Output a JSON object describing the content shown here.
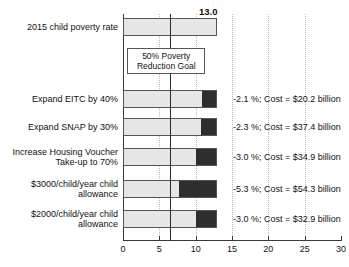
{
  "chart_data": {
    "type": "bar",
    "orientation": "horizontal",
    "stacked": true,
    "title": "",
    "xlabel": "",
    "ylabel": "",
    "xlim": [
      0,
      30
    ],
    "xticks": [
      0,
      5,
      10,
      15,
      20,
      25,
      30
    ],
    "xticklabels": [
      "0",
      "5",
      "10",
      "15",
      "20",
      "25",
      "30"
    ],
    "gridlines": [
      5,
      10,
      15,
      20,
      25
    ],
    "grid": true,
    "legend": "none",
    "baseline_total": 13.0,
    "baseline_label": "13.0",
    "goal_line_value": 6.5,
    "annotation_box": {
      "line1": "50% Poverty",
      "line2": "Reduction Goal"
    },
    "categories": [
      "2015 child poverty rate",
      "Expand EITC by 40%",
      "Expand SNAP by 30%",
      "Increase Housing Voucher Take-up to 70%",
      "$3000/child/year child allowance",
      "$2000/child/year child allowance"
    ],
    "series": [
      {
        "name": "Remaining child poverty rate",
        "color": "#e6e6e6",
        "values": [
          13.0,
          10.9,
          10.7,
          10.0,
          7.7,
          10.0
        ]
      },
      {
        "name": "Poverty rate reduction",
        "color": "#2e2e2e",
        "values": [
          0.0,
          2.1,
          2.3,
          3.0,
          5.3,
          3.0
        ]
      }
    ],
    "rows": [
      {
        "label_lines": [
          "2015 child poverty rate"
        ],
        "light": 13.0,
        "dark": 0.0,
        "end_label": "13.0",
        "note": ""
      },
      {
        "label_lines": [
          "Expand EITC by 40%"
        ],
        "light": 10.9,
        "dark": 2.1,
        "end_label": "",
        "note": "-2.1 %; Cost = $20.2 billion"
      },
      {
        "label_lines": [
          "Expand SNAP by 30%"
        ],
        "light": 10.7,
        "dark": 2.3,
        "end_label": "",
        "note": "-2.3 %; Cost = $37.4 billion"
      },
      {
        "label_lines": [
          "Increase Housing Voucher",
          "Take-up to 70%"
        ],
        "light": 10.0,
        "dark": 3.0,
        "end_label": "",
        "note": "-3.0 %; Cost = $34.9 billion"
      },
      {
        "label_lines": [
          "$3000/child/year child",
          "allowance"
        ],
        "light": 7.7,
        "dark": 5.3,
        "end_label": "",
        "note": "-5.3 %; Cost = $54.3 billion"
      },
      {
        "label_lines": [
          "$2000/child/year child",
          "allowance"
        ],
        "light": 10.0,
        "dark": 3.0,
        "end_label": "",
        "note": "-3.0 %; Cost = $32.9 billion"
      }
    ]
  }
}
